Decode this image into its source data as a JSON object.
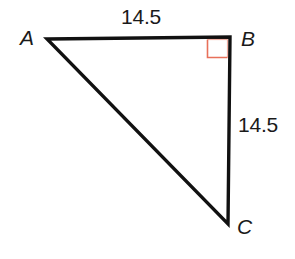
{
  "figure": {
    "type": "right-triangle-diagram",
    "background_color": "#ffffff",
    "stroke_color": "#111111",
    "stroke_width": 3,
    "right_angle_marker_color": "#e8705a"
  },
  "vertices": [
    {
      "name": "A",
      "label": "A",
      "x": 47,
      "y": 39
    },
    {
      "name": "B",
      "label": "B",
      "x": 230,
      "y": 37
    },
    {
      "name": "C",
      "label": "C",
      "x": 228,
      "y": 224
    }
  ],
  "sides": [
    {
      "name": "AB",
      "label": "14.5",
      "from": "A",
      "to": "B",
      "position": "top"
    },
    {
      "name": "BC",
      "label": "14.5",
      "from": "B",
      "to": "C",
      "position": "right"
    },
    {
      "name": "CA",
      "label": "",
      "from": "C",
      "to": "A",
      "position": "hypotenuse"
    }
  ],
  "angles": [
    {
      "at": "B",
      "type": "right-angle",
      "marked": true,
      "marker": "square",
      "color": "#e8705a"
    }
  ],
  "chart_data": {
    "type": "diagram",
    "title": "",
    "shape": "right triangle",
    "labels": {
      "vertex_a": "A",
      "vertex_b": "B",
      "vertex_c": "C",
      "side_ab": "14.5",
      "side_bc": "14.5"
    }
  }
}
